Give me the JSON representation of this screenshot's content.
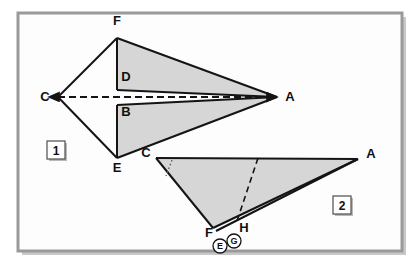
{
  "canvas": {
    "width": 419,
    "height": 268,
    "background": "#ffffff",
    "frame": {
      "stroke": "#9a9a9a",
      "shadow": "#c8c8c8",
      "fill": "#fdfdfd",
      "x": 18,
      "y": 13,
      "width": 384,
      "height": 238
    }
  },
  "style": {
    "shade_fill": "#d6d6d6",
    "line_stroke": "#141414",
    "dash_stroke": "#141414",
    "dot_stroke": "#5a5a5a",
    "label_color": "#111111",
    "badge_border": "#4d4d4d",
    "badge_fill": "#ffffff",
    "badge_shadow": "#b9b9b9"
  },
  "figures": [
    {
      "id": "figure-1",
      "badge": "1",
      "badge_pos": {
        "x": 47,
        "y": 141,
        "w": 18,
        "h": 18
      },
      "description": "Kite CFAE with two shaded triangles FDA and BEA meeting at apex A; dashed axis C to A.",
      "vertices": {
        "F": {
          "x": 117,
          "y": 38
        },
        "C": {
          "x": 58,
          "y": 97
        },
        "E": {
          "x": 117,
          "y": 158
        },
        "A": {
          "x": 277,
          "y": 97
        },
        "D": {
          "x": 117,
          "y": 90
        },
        "B": {
          "x": 117,
          "y": 105
        }
      },
      "labels": [
        {
          "name": "F",
          "text": "F",
          "x": 117,
          "y": 25
        },
        {
          "name": "C",
          "text": "C",
          "x": 45,
          "y": 101
        },
        {
          "name": "E",
          "text": "E",
          "x": 117,
          "y": 172
        },
        {
          "name": "A",
          "text": "A",
          "x": 290,
          "y": 101
        },
        {
          "name": "D",
          "text": "D",
          "x": 126,
          "y": 81
        },
        {
          "name": "B",
          "text": "B",
          "x": 126,
          "y": 116
        }
      ],
      "shaded_polygons": [
        {
          "name": "triangle-FDA",
          "points": "117,38 117,90 277,97"
        },
        {
          "name": "triangle-BEA",
          "points": "117,105 117,158 277,97"
        }
      ],
      "outline_paths": [
        {
          "name": "edge-C-F",
          "points": "58,97 117,38"
        },
        {
          "name": "edge-C-E",
          "points": "58,97 117,158"
        },
        {
          "name": "edge-F-A",
          "points": "117,38 277,97"
        },
        {
          "name": "edge-E-A",
          "points": "117,158 277,97"
        },
        {
          "name": "edge-F-D",
          "points": "117,38 117,90"
        },
        {
          "name": "edge-B-E",
          "points": "117,105 117,158"
        },
        {
          "name": "edge-D-A",
          "points": "117,90 277,97"
        },
        {
          "name": "edge-B-A",
          "points": "117,105 277,97"
        }
      ],
      "dashed_axis": {
        "name": "axis-C-A",
        "from": "58,97",
        "to": "277,97",
        "arrows": "both"
      }
    },
    {
      "id": "figure-2",
      "badge": "2",
      "badge_pos": {
        "x": 333,
        "y": 196,
        "w": 18,
        "h": 18
      },
      "description": "Flattened triangle C-A-F with folded sliver along F-H-A; dashed crease to H; dotted angle arc at C.",
      "vertices": {
        "C": {
          "x": 156,
          "y": 158
        },
        "A": {
          "x": 358,
          "y": 159
        },
        "F": {
          "x": 213,
          "y": 228
        },
        "H": {
          "x": 236,
          "y": 224
        },
        "G": {
          "x": 236,
          "y": 233
        },
        "E": {
          "x": 218,
          "y": 240
        },
        "crease_top": {
          "x": 258,
          "y": 158
        }
      },
      "labels": [
        {
          "name": "C",
          "text": "C",
          "x": 146,
          "y": 157
        },
        {
          "name": "A",
          "text": "A",
          "x": 371,
          "y": 158
        },
        {
          "name": "F",
          "text": "F",
          "x": 209,
          "y": 237
        },
        {
          "name": "H",
          "text": "H",
          "x": 244,
          "y": 232
        }
      ],
      "circled_labels": [
        {
          "name": "E",
          "text": "E",
          "cx": 220,
          "cy": 246,
          "r": 7
        },
        {
          "name": "G",
          "text": "G",
          "cx": 234,
          "cy": 241,
          "r": 7
        }
      ],
      "shaded_polygons": [
        {
          "name": "triangle-C-A-F",
          "points": "156,158 358,159 213,228"
        }
      ],
      "outline_paths": [
        {
          "name": "edge-C-A",
          "points": "156,158 358,159"
        },
        {
          "name": "edge-C-F",
          "points": "156,158 213,228"
        },
        {
          "name": "edge-F-A",
          "points": "213,228 358,159"
        },
        {
          "name": "fold-sliver",
          "points": "216,231 358,159"
        }
      ],
      "dashed_crease": {
        "name": "crease-to-H",
        "from": "258,158",
        "to": "236,224"
      },
      "dotted_arc": {
        "name": "angle-arc-at-C",
        "from": "172,160",
        "to": "166,176"
      }
    }
  ]
}
